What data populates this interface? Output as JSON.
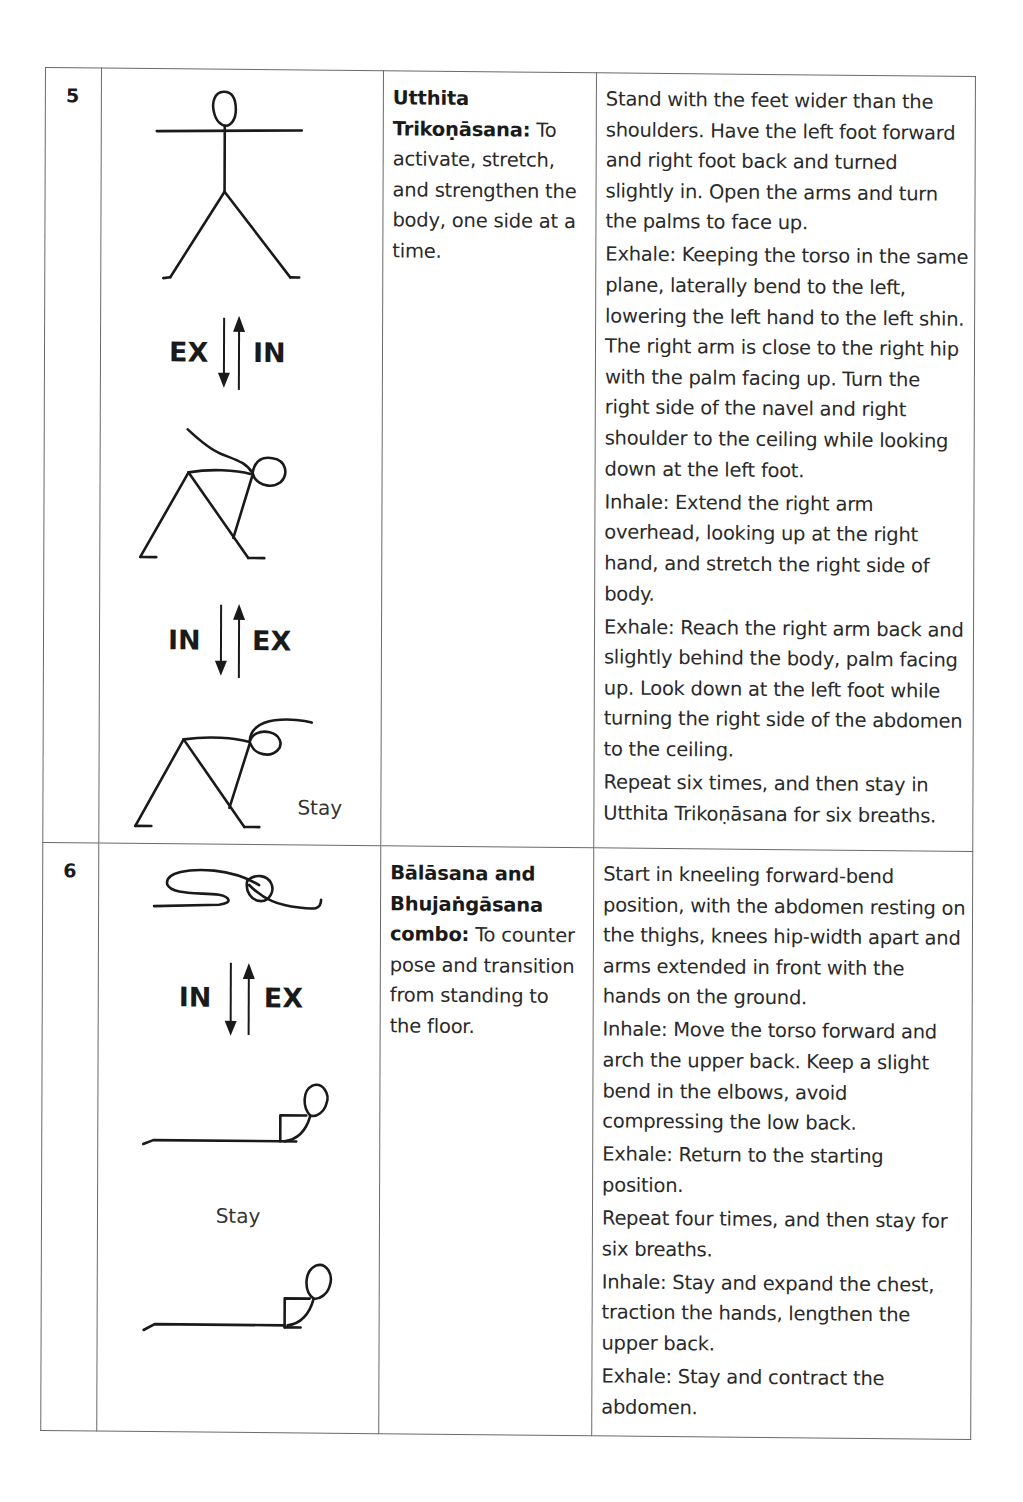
{
  "page_header_fragment": "",
  "rows": [
    {
      "number": "5",
      "pose_name": "Utthita Trikoṇāsana:",
      "purpose": "To activate, stretch, and strengthen the body, one side at a time.",
      "figure": {
        "transition_1": {
          "left": "EX",
          "right": "IN"
        },
        "transition_2": {
          "left": "IN",
          "right": "EX"
        },
        "final_label": "Stay"
      },
      "instructions": [
        "Stand with the feet wider than the shoulders. Have the left foot forward and right foot back and turned slightly in. Open the arms and turn the palms to face up.",
        "Exhale: Keeping the torso in the same plane, laterally bend to the left, lowering the left hand to the left shin. The right arm is close to the right hip with the palm facing up. Turn the right side of the navel and right shoulder to the ceiling while looking down at the left foot.",
        "Inhale: Extend the right arm overhead, looking up at the right hand, and stretch the right side of body.",
        "Exhale: Reach the right arm back and slightly behind the body, palm facing up. Look down at the left foot while turning the right side of the abdomen to the ceiling.",
        "Repeat six times, and then stay in Utthita Trikoṇāsana for six breaths."
      ]
    },
    {
      "number": "6",
      "pose_name": "Bālāsana and Bhujaṅgāsana combo:",
      "purpose": "To counter pose and transition from standing to the floor.",
      "figure": {
        "transition_1": {
          "left": "IN",
          "right": "EX"
        },
        "middle_label": "Stay"
      },
      "instructions": [
        "Start in kneeling forward-bend position, with the abdomen resting on the thighs, knees hip-width apart and arms extended in front with the hands on the ground.",
        "Inhale: Move the torso forward and arch the upper back. Keep a slight bend in the elbows, avoid compressing the low back.",
        "Exhale: Return to the starting position.",
        "Repeat four times, and then stay for six breaths.",
        "Inhale: Stay and expand the chest, traction the hands, lengthen the upper back.",
        "Exhale: Stay and contract the abdomen."
      ]
    }
  ]
}
